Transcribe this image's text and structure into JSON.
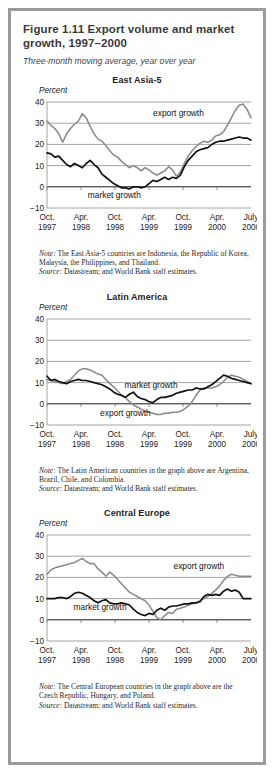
{
  "figure": {
    "title": "Figure 1.11  Export volume and market growth, 1997–2000",
    "subtitle": "Three-month moving average, year over year"
  },
  "panels": [
    {
      "id": "east-asia-5",
      "title": "East Asia-5",
      "unit_label": "Percent",
      "note_label": "Note:",
      "note_text": " The East Asia-5 countries are Indonesia, the Republic of Korea, Malaysia, the Philippines, and Thailand.",
      "source_label": "Source:",
      "source_text": " Datastream; and World Bank staff estimates.",
      "labels": {
        "export": "export growth",
        "market": "market growth"
      }
    },
    {
      "id": "latin-america",
      "title": "Latin America",
      "unit_label": "Percent",
      "note_label": "Note:",
      "note_text": " The Latin American countries in the graph above are Argentina, Brazil, Chile, and Colombia.",
      "source_label": "Source:",
      "source_text": " Datastream; and World Bank staff estimates.",
      "labels": {
        "export": "export growth",
        "market": "market growth"
      }
    },
    {
      "id": "central-europe",
      "title": "Central Europe",
      "unit_label": "Percent",
      "note_label": "Note:",
      "note_text": " The Central European countries in the graph above are the Czech Republic, Hungary, and Poland.",
      "source_label": "Source:",
      "source_text": " Datastream; and World Bank staff estimates.",
      "labels": {
        "export": "export growth",
        "market": "market growth"
      }
    }
  ],
  "chart_data": [
    {
      "type": "line",
      "title": "East Asia-5",
      "xlabel": "",
      "ylabel": "Percent",
      "ylim": [
        -10,
        40
      ],
      "yticks": [
        -10,
        0,
        10,
        20,
        30,
        40
      ],
      "ytick_labels": [
        "−10",
        "0",
        "10",
        "20",
        "30",
        "40"
      ],
      "grid": true,
      "legend": "inline-annotations",
      "x_tick_labels": [
        [
          "Oct.",
          "1997"
        ],
        [
          "Apr.",
          "1998"
        ],
        [
          "Oct.",
          "1998"
        ],
        [
          "Apr.",
          "1999"
        ],
        [
          "Oct.",
          "1999"
        ],
        [
          "Apr.",
          "2000"
        ],
        [
          "July",
          "2000"
        ]
      ],
      "x_range": [
        "Oct. 1997",
        "July 2000"
      ],
      "series": [
        {
          "name": "export growth",
          "color": "#8a8a8a",
          "values": [
            31.0,
            29.0,
            27.5,
            25.0,
            21.0,
            25.0,
            27.5,
            29.5,
            31.0,
            34.5,
            32.5,
            28.5,
            25.0,
            22.5,
            21.5,
            19.5,
            17.0,
            15.0,
            14.0,
            12.0,
            10.5,
            9.0,
            10.0,
            9.0,
            7.5,
            9.0,
            8.0,
            6.5,
            5.5,
            6.5,
            7.5,
            9.5,
            8.0,
            5.0,
            7.0,
            11.0,
            14.5,
            17.0,
            19.0,
            20.5,
            21.5,
            21.0,
            22.0,
            24.0,
            24.5,
            26.0,
            29.0,
            32.5,
            36.0,
            38.5,
            39.0,
            36.5,
            32.5
          ]
        },
        {
          "name": "market growth",
          "color": "#121212",
          "values": [
            16.0,
            15.5,
            14.0,
            14.5,
            12.5,
            10.5,
            9.5,
            11.0,
            10.0,
            9.0,
            11.0,
            12.5,
            10.5,
            9.0,
            6.0,
            4.5,
            3.0,
            1.5,
            0.5,
            -0.5,
            -0.5,
            -1.0,
            0.0,
            0.0,
            -0.5,
            0.0,
            1.5,
            3.0,
            2.5,
            3.5,
            4.5,
            3.5,
            4.5,
            4.0,
            5.5,
            9.5,
            12.5,
            14.5,
            16.5,
            17.5,
            18.0,
            18.5,
            20.0,
            21.0,
            21.5,
            21.5,
            22.0,
            22.5,
            23.0,
            23.5,
            23.0,
            23.0,
            22.0
          ]
        }
      ]
    },
    {
      "type": "line",
      "title": "Latin America",
      "xlabel": "",
      "ylabel": "Percent",
      "ylim": [
        -10,
        40
      ],
      "yticks": [
        -10,
        0,
        10,
        20,
        30,
        40
      ],
      "ytick_labels": [
        "−10",
        "0",
        "10",
        "20",
        "30",
        "40"
      ],
      "grid": true,
      "legend": "inline-annotations",
      "x_tick_labels": [
        [
          "Oct.",
          "1997"
        ],
        [
          "Apr.",
          "1998"
        ],
        [
          "Oct.",
          "1998"
        ],
        [
          "Apr.",
          "1999"
        ],
        [
          "Oct.",
          "1999"
        ],
        [
          "Apr.",
          "2000"
        ],
        [
          "July",
          "2000"
        ]
      ],
      "x_range": [
        "Oct. 1997",
        "July 2000"
      ],
      "series": [
        {
          "name": "export growth",
          "color": "#8a8a8a",
          "values": [
            11.5,
            11.0,
            10.5,
            10.0,
            9.5,
            10.5,
            11.5,
            13.5,
            15.5,
            16.5,
            16.5,
            16.0,
            15.0,
            14.0,
            13.5,
            11.5,
            9.5,
            8.0,
            6.0,
            4.0,
            3.0,
            1.0,
            -0.5,
            -1.5,
            -2.5,
            -3.5,
            -4.0,
            -4.5,
            -5.0,
            -5.0,
            -4.5,
            -4.5,
            -4.0,
            -4.0,
            -3.5,
            -2.5,
            -1.0,
            1.0,
            4.0,
            6.5,
            7.5,
            7.5,
            7.5,
            8.0,
            9.0,
            10.5,
            12.5,
            13.5,
            13.0,
            12.5,
            11.5,
            10.5,
            9.5
          ]
        },
        {
          "name": "market growth",
          "color": "#121212",
          "values": [
            13.0,
            11.0,
            11.5,
            10.5,
            10.0,
            9.5,
            10.5,
            11.0,
            11.5,
            11.0,
            11.0,
            10.5,
            10.0,
            9.5,
            9.0,
            8.0,
            7.0,
            5.5,
            4.5,
            4.0,
            3.0,
            4.5,
            5.5,
            3.5,
            2.5,
            2.0,
            1.0,
            0.5,
            2.0,
            3.0,
            3.0,
            3.5,
            4.0,
            5.0,
            5.5,
            6.0,
            6.5,
            6.5,
            7.5,
            7.0,
            7.0,
            8.0,
            9.0,
            10.5,
            12.0,
            13.5,
            13.0,
            12.0,
            11.5,
            11.0,
            10.5,
            10.0,
            9.5
          ]
        }
      ]
    },
    {
      "type": "line",
      "title": "Central Europe",
      "xlabel": "",
      "ylabel": "Percent",
      "ylim": [
        -10,
        40
      ],
      "yticks": [
        -10,
        0,
        10,
        20,
        30,
        40
      ],
      "ytick_labels": [
        "−10",
        "0",
        "10",
        "20",
        "30",
        "40"
      ],
      "grid": true,
      "legend": "inline-annotations",
      "x_tick_labels": [
        [
          "Oct.",
          "1997"
        ],
        [
          "Apr.",
          "1998"
        ],
        [
          "Oct.",
          "1998"
        ],
        [
          "Apr.",
          "1999"
        ],
        [
          "Oct.",
          "1999"
        ],
        [
          "Apr.",
          "2000"
        ],
        [
          "July",
          "2000"
        ]
      ],
      "x_range": [
        "Oct. 1997",
        "July 2000"
      ],
      "series": [
        {
          "name": "export growth",
          "color": "#8a8a8a",
          "values": [
            21.5,
            23.5,
            24.5,
            25.0,
            25.5,
            26.0,
            26.5,
            27.0,
            28.0,
            29.0,
            27.5,
            26.5,
            26.5,
            24.0,
            22.5,
            20.5,
            22.5,
            21.0,
            19.0,
            17.0,
            15.0,
            13.0,
            12.0,
            11.0,
            10.0,
            9.0,
            7.0,
            4.0,
            1.0,
            0.0,
            2.0,
            3.5,
            3.0,
            5.0,
            5.5,
            6.0,
            7.0,
            7.5,
            8.0,
            9.0,
            10.0,
            11.0,
            12.5,
            14.0,
            16.0,
            18.5,
            20.5,
            21.5,
            21.0,
            20.5,
            20.5,
            20.5,
            20.5
          ]
        },
        {
          "name": "market growth",
          "color": "#121212",
          "values": [
            10.0,
            10.0,
            10.0,
            10.5,
            10.5,
            10.0,
            11.0,
            12.5,
            13.0,
            12.5,
            11.5,
            10.5,
            9.0,
            8.0,
            9.0,
            9.5,
            8.0,
            7.5,
            7.5,
            8.0,
            7.5,
            7.0,
            5.0,
            3.5,
            2.5,
            2.0,
            3.0,
            2.5,
            4.5,
            5.5,
            4.5,
            6.0,
            6.5,
            6.5,
            7.0,
            7.5,
            7.5,
            8.0,
            8.0,
            8.5,
            11.0,
            12.0,
            11.5,
            12.0,
            11.5,
            13.5,
            14.5,
            13.5,
            14.0,
            13.0,
            10.0,
            10.0,
            10.0
          ]
        }
      ]
    }
  ]
}
